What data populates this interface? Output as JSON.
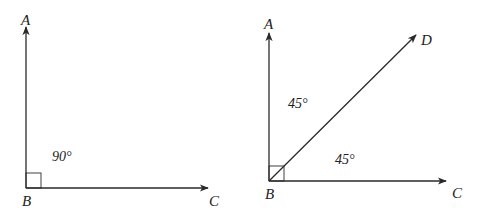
{
  "diagrams": [
    {
      "id": "right-angle",
      "vertex": "B",
      "points": {
        "A": "A",
        "B": "B",
        "C": "C"
      },
      "angle_labels": [
        "90°"
      ],
      "right_angle_marker": true
    },
    {
      "id": "bisected-right-angle",
      "vertex": "B",
      "points": {
        "A": "A",
        "B": "B",
        "C": "C",
        "D": "D"
      },
      "angle_labels": [
        "45°",
        "45°"
      ],
      "right_angle_marker": true
    }
  ]
}
